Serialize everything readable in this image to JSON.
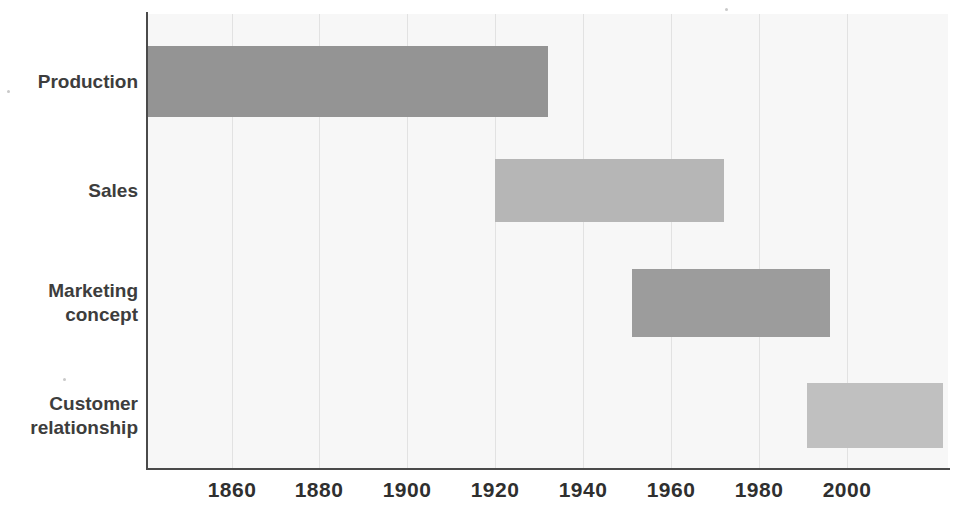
{
  "chart_data": {
    "type": "bar",
    "orientation": "horizontal",
    "title": "",
    "xlabel": "",
    "ylabel": "",
    "xlim": [
      1841,
      2023
    ],
    "grid": true,
    "legend": "none",
    "xticks": [
      "1860",
      "1880",
      "1900",
      "1920",
      "1940",
      "1960",
      "1980",
      "2000"
    ],
    "xtick_values": [
      1860,
      1880,
      1900,
      1920,
      1940,
      1960,
      1980,
      2000
    ],
    "categories": [
      "Production",
      "Sales",
      "Marketing concept",
      "Customer relationship"
    ],
    "bars": [
      {
        "label": "Production",
        "label_lines": "Production",
        "start": 1841,
        "end": 1932,
        "color": "#949494"
      },
      {
        "label": "Sales",
        "label_lines": "Sales",
        "start": 1920,
        "end": 1972,
        "color": "#b6b6b6"
      },
      {
        "label": "Marketing concept",
        "label_lines": "Marketing\nconcept",
        "start": 1951,
        "end": 1996,
        "color": "#9c9c9c"
      },
      {
        "label": "Customer relationship",
        "label_lines": "Customer\nrelationship",
        "start": 1991,
        "end": 2022,
        "color": "#c0c0c0"
      }
    ]
  },
  "colors": {
    "plot_background": "#f7f7f7",
    "page_background": "#ffffff",
    "axis": "#4a4a4a",
    "gridline": "#e2e2e2",
    "tick_text": "#2f2f2f",
    "category_text": "#3d3d3d"
  }
}
